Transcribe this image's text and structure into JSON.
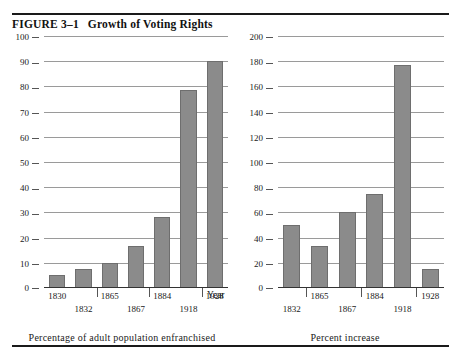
{
  "figure": {
    "label": "FIGURE 3–1",
    "title": "Growth of Voting Rights",
    "shared_axis_label": "Year"
  },
  "chart_data": [
    {
      "type": "bar",
      "title": "Percentage of adult population enfranchised",
      "xlabel": "Year",
      "ylabel": "",
      "ylim": [
        0,
        100
      ],
      "yticks": [
        0,
        10,
        20,
        30,
        40,
        50,
        60,
        70,
        80,
        90,
        100
      ],
      "grid": true,
      "legend": "none",
      "categories": [
        "1830",
        "1832",
        "1865",
        "1867",
        "1884",
        "1918",
        "1928"
      ],
      "values": [
        5,
        7.5,
        10,
        16.5,
        28,
        78.5,
        90
      ],
      "bar_color": "#8b8b8b"
    },
    {
      "type": "bar",
      "title": "Percent increase",
      "xlabel": "Year",
      "ylabel": "",
      "ylim": [
        0,
        200
      ],
      "yticks": [
        0,
        20,
        40,
        60,
        80,
        100,
        120,
        140,
        160,
        180,
        200
      ],
      "grid": true,
      "legend": "none",
      "categories": [
        "1832",
        "1865",
        "1867",
        "1884",
        "1918",
        "1928"
      ],
      "values": [
        50,
        33,
        60,
        75,
        177,
        15
      ],
      "bar_color": "#8b8b8b"
    }
  ],
  "left_chart": {
    "caption": "Percentage of adult population enfranchised",
    "yticks": [
      "100",
      "90",
      "80",
      "70",
      "60",
      "50",
      "40",
      "30",
      "20",
      "10",
      "0"
    ],
    "xlabels_row1": [
      "1830",
      "1865",
      "1884",
      "1928"
    ],
    "xlabels_row2": [
      "1832",
      "1867",
      "1918"
    ]
  },
  "right_chart": {
    "caption": "Percent increase",
    "yticks": [
      "200",
      "180",
      "160",
      "140",
      "120",
      "100",
      "80",
      "60",
      "40",
      "20",
      "0"
    ],
    "xlabels_row1": [
      "1865",
      "1884",
      "1928"
    ],
    "xlabels_row2": [
      "1832",
      "1867",
      "1918"
    ]
  }
}
